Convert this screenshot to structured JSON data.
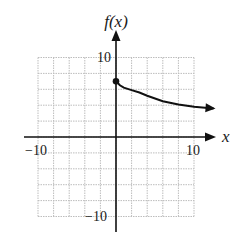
{
  "chart_data": {
    "type": "line",
    "title": "",
    "xlabel": "x",
    "ylabel": "f(x)",
    "xlim": [
      -10,
      10
    ],
    "ylim": [
      -10,
      10
    ],
    "grid": true,
    "grid_step": 2,
    "x_ticks_labeled": [
      -10,
      10
    ],
    "y_ticks_labeled": [
      10,
      -10
    ],
    "tick_labels": {
      "x_neg": "−10",
      "x_pos": "10",
      "y_pos": "10",
      "y_neg": "−10"
    },
    "series": [
      {
        "name": "f(x)",
        "start_point": {
          "x": 0,
          "y": 7,
          "closed": true
        },
        "end_arrow": true,
        "points": [
          {
            "x": 0,
            "y": 7
          },
          {
            "x": 0.5,
            "y": 6.5
          },
          {
            "x": 1,
            "y": 6.2
          },
          {
            "x": 2,
            "y": 5.9
          },
          {
            "x": 3,
            "y": 5.6
          },
          {
            "x": 4,
            "y": 5.2
          },
          {
            "x": 6,
            "y": 4.5
          },
          {
            "x": 8,
            "y": 4.1
          },
          {
            "x": 10,
            "y": 3.8
          },
          {
            "x": 12.5,
            "y": 3.6
          }
        ]
      }
    ]
  },
  "labels": {
    "y_axis": "f(x)",
    "x_axis": "x",
    "x_neg": "−10",
    "x_pos": "10",
    "y_pos": "10",
    "y_neg": "−10"
  }
}
